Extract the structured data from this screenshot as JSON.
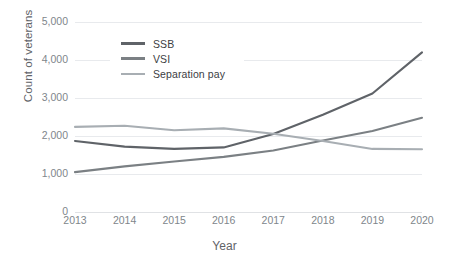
{
  "chart_data": {
    "type": "line",
    "title": "",
    "xlabel": "Year",
    "ylabel": "Count of veterans",
    "categories": [
      "2013",
      "2014",
      "2015",
      "2016",
      "2017",
      "2018",
      "2019",
      "2020"
    ],
    "x": [
      2013,
      2014,
      2015,
      2016,
      2017,
      2018,
      2019,
      2020
    ],
    "xlim": [
      2013,
      2020
    ],
    "ylim": [
      0,
      5000
    ],
    "yticks": [
      0,
      1000,
      2000,
      3000,
      4000,
      5000
    ],
    "ytick_labels": [
      "0",
      "1,000",
      "2,000",
      "3,000",
      "4,000",
      "5,000"
    ],
    "grid": true,
    "legend_position": "upper-left-inside",
    "series": [
      {
        "name": "SSB",
        "color": "#5f6368",
        "values": [
          1870,
          1720,
          1660,
          1700,
          2050,
          2560,
          3120,
          4200
        ]
      },
      {
        "name": "VSI",
        "color": "#7b8084",
        "values": [
          1050,
          1200,
          1330,
          1450,
          1620,
          1880,
          2130,
          2480
        ]
      },
      {
        "name": "Separation pay",
        "color": "#a8aeb3",
        "values": [
          2240,
          2270,
          2150,
          2200,
          2060,
          1870,
          1660,
          1650
        ]
      }
    ]
  },
  "legend": {
    "items": [
      {
        "label": "SSB",
        "color": "#5f6368"
      },
      {
        "label": "VSI",
        "color": "#7b8084"
      },
      {
        "label": "Separation pay",
        "color": "#a8aeb3"
      }
    ]
  },
  "axes": {
    "y_title": "Count of veterans",
    "x_title": "Year"
  },
  "colors": {
    "gridline": "#e8eaed",
    "tick_text": "#80868b",
    "axis_title_text": "#5f6368",
    "legend_text": "#3c4043",
    "background": "#ffffff"
  }
}
